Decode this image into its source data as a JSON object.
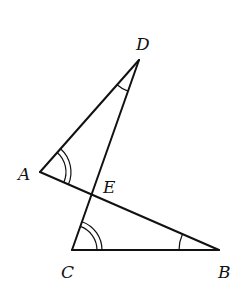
{
  "diagram": {
    "type": "geometry",
    "points": {
      "A": {
        "label": "A",
        "x": 40,
        "y": 172
      },
      "B": {
        "label": "B",
        "x": 219,
        "y": 250
      },
      "C": {
        "label": "C",
        "x": 72,
        "y": 250
      },
      "D": {
        "label": "D",
        "x": 139,
        "y": 60
      },
      "E": {
        "label": "E",
        "x": 91,
        "y": 195
      }
    },
    "segments": [
      "AD",
      "DC",
      "AB",
      "CB"
    ],
    "angle_marks": [
      {
        "vertex": "A",
        "arcs": 2
      },
      {
        "vertex": "C",
        "arcs": 2
      },
      {
        "vertex": "D",
        "arcs": 1
      },
      {
        "vertex": "B",
        "arcs": 1
      }
    ]
  }
}
